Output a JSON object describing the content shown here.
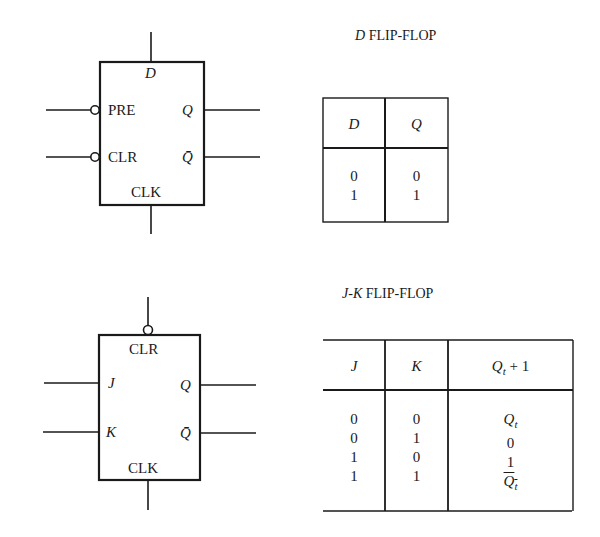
{
  "d_flipflop": {
    "title_var": "D",
    "title_text": "FLIP-FLOP",
    "symbol": {
      "top_label": "D",
      "left_pins": [
        "PRE",
        "CLR"
      ],
      "right_pins": [
        "Q",
        "Q̄"
      ],
      "bottom_label": "CLK"
    },
    "table": {
      "headers": [
        "D",
        "Q"
      ],
      "columns": [
        [
          "0",
          "1"
        ],
        [
          "0",
          "1"
        ]
      ]
    }
  },
  "jk_flipflop": {
    "title_var": "J-K",
    "title_text": "FLIP-FLOP",
    "symbol": {
      "top_label": "CLR",
      "left_pins": [
        "J",
        "K"
      ],
      "right_pins": [
        "Q",
        "Q̄"
      ],
      "bottom_label": "CLK"
    },
    "table": {
      "headers": [
        "J",
        "K",
        "Qt + 1"
      ],
      "columns": [
        [
          "0",
          "0",
          "1",
          "1"
        ],
        [
          "0",
          "1",
          "0",
          "1"
        ],
        [
          "Qt",
          "0",
          "1",
          "Qt̄"
        ]
      ]
    }
  },
  "colors": {
    "ink": "#1a1a1a",
    "background": "#ffffff"
  }
}
